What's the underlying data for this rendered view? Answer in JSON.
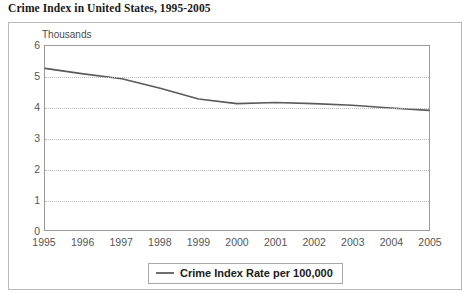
{
  "title": "Crime Index in United States, 1995-2005",
  "axis_unit_label": "Thousands",
  "legend": {
    "label": "Crime Index Rate per 100,000",
    "swatch_color": "#6e6e6e"
  },
  "colors": {
    "line": "#5a5a5a",
    "gridline": "#bcbcbc",
    "plot_border": "#9a9a9a",
    "frame_border": "#b8b8b8",
    "tick_text": "#555555",
    "title_text": "#1a1a1a"
  },
  "chart_data": {
    "type": "line",
    "title": "Crime Index in United States, 1995-2005",
    "xlabel": "",
    "ylabel": "Thousands",
    "categories": [
      "1995",
      "1996",
      "1997",
      "1998",
      "1999",
      "2000",
      "2001",
      "2002",
      "2003",
      "2004",
      "2005"
    ],
    "x": [
      1995,
      1996,
      1997,
      1998,
      1999,
      2000,
      2001,
      2002,
      2003,
      2004,
      2005
    ],
    "series": [
      {
        "name": "Crime Index Rate per 100,000",
        "values": [
          5.27,
          5.09,
          4.93,
          4.62,
          4.27,
          4.12,
          4.16,
          4.12,
          4.07,
          3.98,
          3.9
        ]
      }
    ],
    "ylim": [
      0,
      6
    ],
    "yticks": [
      0,
      1,
      2,
      3,
      4,
      5,
      6
    ],
    "ytick_labels": [
      "0",
      "1",
      "2",
      "3",
      "4",
      "5",
      "6"
    ],
    "grid": true,
    "grid_axis": "y",
    "legend_position": "bottom"
  }
}
